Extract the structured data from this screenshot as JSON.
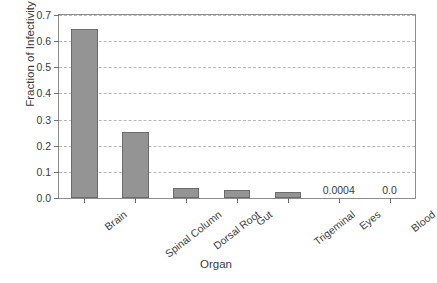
{
  "chart_data": {
    "type": "bar",
    "title": "",
    "xlabel": "Organ",
    "ylabel": "Fraction of Infectivity",
    "categories": [
      "Brain",
      "Spinal Column",
      "Dorsal Root",
      "Gut",
      "Trigeminal",
      "Eyes",
      "Blood"
    ],
    "values": [
      0.645,
      0.253,
      0.038,
      0.029,
      0.022,
      0.0004,
      0.0
    ],
    "ylim": [
      0.0,
      0.7
    ],
    "ytick_labels": [
      "0.0",
      "0.1",
      "0.2",
      "0.3",
      "0.4",
      "0.5",
      "0.6",
      "0.7"
    ],
    "ytick_values": [
      0.0,
      0.1,
      0.2,
      0.3,
      0.4,
      0.5,
      0.6,
      0.7
    ],
    "grid": true,
    "grid_axis": "y",
    "grid_style": "dashed",
    "legend": false,
    "annotations": [
      {
        "category": "Eyes",
        "text": "0.0004"
      },
      {
        "category": "Blood",
        "text": "0.0"
      }
    ],
    "bar_color": "#949494",
    "bar_edge_color": "#6b6b6b",
    "grid_color": "#b9b9b9",
    "axis_color": "#8d8d8d",
    "text_color": "#3a3a3a",
    "background": "#ffffff"
  }
}
